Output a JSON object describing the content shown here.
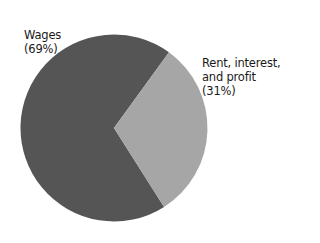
{
  "chart_data": {
    "type": "pie",
    "title": "",
    "slices": [
      {
        "label": "Wages",
        "value": 69,
        "display": "(69%)",
        "color": "#555555"
      },
      {
        "label": "Rent, interest, and profit",
        "value": 31,
        "display": "(31%)",
        "color": "#a6a6a6"
      }
    ],
    "legend": "none",
    "annotations": [
      "Wages (69%)",
      "Rent, interest, and profit (31%)"
    ]
  },
  "labels": {
    "wages": {
      "line1": "Wages",
      "line2": "(69%)"
    },
    "rent": {
      "line1": "Rent, interest,",
      "line2": "and profit",
      "line3": "(31%)"
    }
  }
}
